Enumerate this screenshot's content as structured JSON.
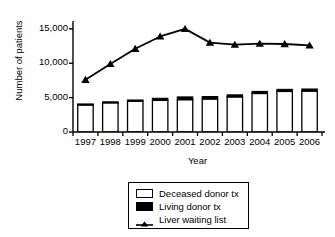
{
  "chart_data": {
    "type": "bar",
    "title": "",
    "xlabel": "Year",
    "ylabel": "Number of patients",
    "categories": [
      "1997",
      "1998",
      "1999",
      "2000",
      "2001",
      "2002",
      "2003",
      "2004",
      "2005",
      "2006"
    ],
    "ylim": [
      0,
      16000
    ],
    "yticks": [
      0,
      5000,
      10000,
      15000
    ],
    "ytick_labels": [
      "0",
      "5,000",
      "10,000",
      "15,000"
    ],
    "grid": false,
    "legend_position": "below-center",
    "stacked": true,
    "series": [
      {
        "name": "Deceased donor tx",
        "type": "bar",
        "color": "#ffffff",
        "edge": "#000000",
        "values": [
          4000,
          4300,
          4500,
          4600,
          4700,
          4800,
          5100,
          5600,
          5900,
          5950
        ]
      },
      {
        "name": "Living donor tx",
        "type": "bar",
        "color": "#000000",
        "edge": "#000000",
        "values": [
          70,
          80,
          150,
          300,
          400,
          350,
          300,
          300,
          300,
          300
        ]
      },
      {
        "name": "Liver waiting list",
        "type": "line",
        "color": "#000000",
        "marker": "triangle",
        "values": [
          7600,
          9900,
          12100,
          13900,
          15000,
          13000,
          12700,
          12850,
          12800,
          12600
        ]
      }
    ]
  },
  "legend": {
    "items": [
      {
        "label": "Deceased donor tx",
        "swatch": "open-square"
      },
      {
        "label": "Living donor tx",
        "swatch": "filled-square"
      },
      {
        "label": "Liver waiting list",
        "swatch": "line-triangle"
      }
    ]
  }
}
